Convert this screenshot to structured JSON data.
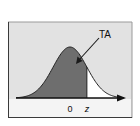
{
  "diagram": {
    "type": "normal-distribution-area",
    "labels": {
      "area_label": "TA",
      "mean_label": "0",
      "z_label": "z"
    },
    "colors": {
      "shaded_area": "#6e6e6e",
      "background": "#e2e2e2",
      "frame_dark": "#3a3a3a",
      "frame_light": "#9a9a9a",
      "curve": "#222222",
      "tail_fill": "#ffffff"
    },
    "distribution": {
      "mean": 0,
      "sd": 1,
      "z": 1.0,
      "x_range": [
        -3.2,
        3.2
      ],
      "shaded_side": "left-of-z"
    }
  }
}
